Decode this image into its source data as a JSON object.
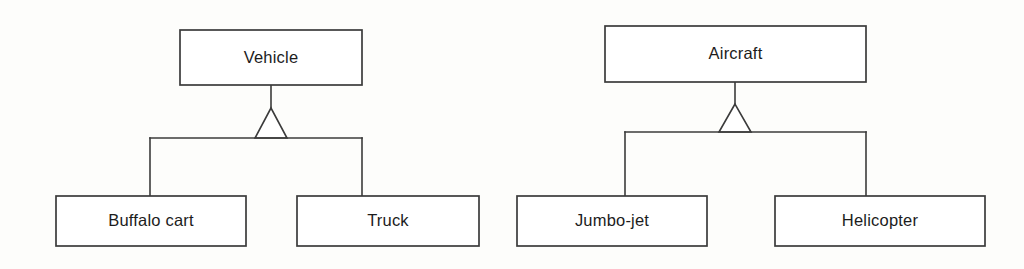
{
  "page": {
    "background_color": "#fdfdfb",
    "line_color": "#3b3b3b",
    "text_color": "#1c1c1c",
    "box_fill": "#ffffff"
  },
  "diagrams": [
    {
      "id": "vehicle-hierarchy",
      "relationship": "generalization",
      "parent": {
        "name": "Vehicle",
        "x": 180,
        "y": 30,
        "width": 182,
        "height": 55
      },
      "connector": {
        "stem_x": 271,
        "bus_y": 138,
        "triangle_apex_y": 108,
        "triangle_half_width": 16,
        "bus_left_x": 150,
        "bus_right_x": 362
      },
      "children": [
        {
          "name": "Buffalo cart",
          "x": 56,
          "y": 196,
          "width": 190,
          "height": 50,
          "drop_x": 150
        },
        {
          "name": "Truck",
          "x": 297,
          "y": 196,
          "width": 182,
          "height": 50,
          "drop_x": 362
        }
      ]
    },
    {
      "id": "aircraft-hierarchy",
      "relationship": "generalization",
      "parent": {
        "name": "Aircraft",
        "x": 605,
        "y": 26,
        "width": 261,
        "height": 56
      },
      "connector": {
        "stem_x": 735,
        "bus_y": 132,
        "triangle_apex_y": 104,
        "triangle_half_width": 16,
        "bus_left_x": 625,
        "bus_right_x": 866
      },
      "children": [
        {
          "name": "Jumbo-jet",
          "x": 517,
          "y": 196,
          "width": 190,
          "height": 50,
          "drop_x": 625
        },
        {
          "name": "Helicopter",
          "x": 775,
          "y": 196,
          "width": 210,
          "height": 50,
          "drop_x": 866
        }
      ]
    }
  ]
}
